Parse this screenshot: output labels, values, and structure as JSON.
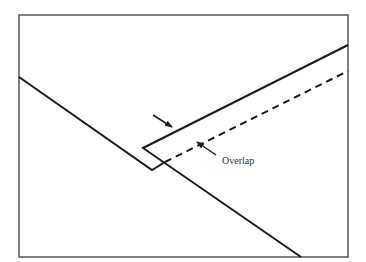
{
  "diagram": {
    "title": "",
    "colors": {
      "stroke": "#1a1a1a",
      "frame": "#555555",
      "background": "#ffffff",
      "text": "#333333"
    },
    "frame": {
      "x": 19,
      "y": 15,
      "width": 329,
      "height": 242
    },
    "lower_strip_edge": {
      "points": "19,77 152,170 165,162"
    },
    "upper_strip_outline": {
      "points": "348,45 143,148 301,257"
    },
    "overlap_dashed_edge": {
      "x1": 165,
      "y1": 162,
      "x2": 348,
      "y2": 71
    },
    "arrows": [
      {
        "name": "upper-edge-arrow",
        "x1": 153,
        "y1": 115,
        "x2": 172,
        "y2": 127
      },
      {
        "name": "overlap-arrow",
        "x1": 216,
        "y1": 155,
        "x2": 197,
        "y2": 142
      }
    ],
    "labels": {
      "overlap": "Overlap"
    }
  }
}
